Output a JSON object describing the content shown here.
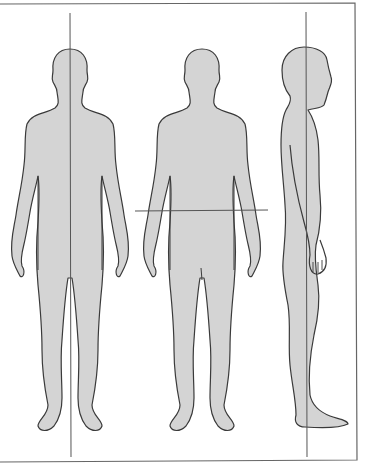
{
  "diagram": {
    "title": "",
    "type": "anatomical body planes",
    "colors": {
      "background": "#ffffff",
      "figure_fill": "#d4d4d4",
      "figure_stroke": "#3a3a3a",
      "plane_line": "#555555",
      "frame": "#666666"
    },
    "figures": [
      {
        "id": "front-figure",
        "view": "anterior",
        "plane": "midsagittal",
        "line_orientation": "vertical"
      },
      {
        "id": "middle-figure",
        "view": "anterior",
        "plane": "transverse",
        "line_orientation": "horizontal"
      },
      {
        "id": "side-figure",
        "view": "lateral",
        "plane": "frontal",
        "line_orientation": "vertical"
      }
    ],
    "labels": []
  }
}
